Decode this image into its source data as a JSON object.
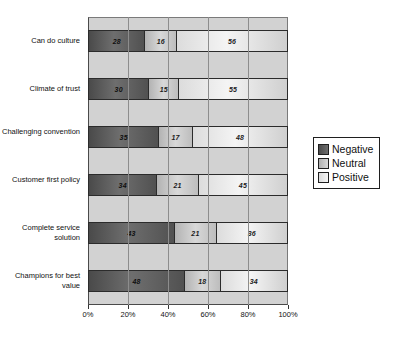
{
  "chart_data": {
    "type": "bar",
    "orientation": "horizontal",
    "stacked": true,
    "normalized_percent": true,
    "title": "",
    "xlabel": "",
    "ylabel": "",
    "xlim": [
      0,
      100
    ],
    "grid": true,
    "legend_position": "right",
    "tick_labels": [
      "0%",
      "20%",
      "40%",
      "60%",
      "80%",
      "100%"
    ],
    "tick_values": [
      0,
      20,
      40,
      60,
      80,
      100
    ],
    "categories": [
      "Can do culture",
      "Climate of trust",
      "Challenging convention",
      "Customer first policy",
      "Complete service solution",
      "Champions for best value"
    ],
    "series": [
      {
        "name": "Negative",
        "color": "#5a5a5a",
        "values": [
          28,
          30,
          35,
          34,
          43,
          48
        ]
      },
      {
        "name": "Neutral",
        "color": "#c8c8c8",
        "values": [
          16,
          15,
          17,
          21,
          21,
          18
        ]
      },
      {
        "name": "Positive",
        "color": "#ececec",
        "values": [
          56,
          55,
          48,
          45,
          36,
          34
        ]
      }
    ]
  },
  "legend": {
    "items": [
      {
        "label": "Negative"
      },
      {
        "label": "Neutral"
      },
      {
        "label": "Positive"
      }
    ]
  }
}
